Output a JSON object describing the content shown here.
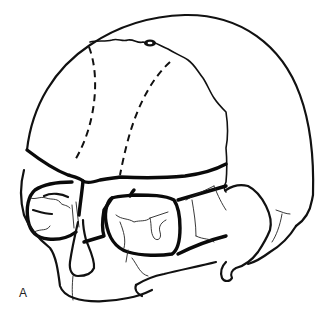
{
  "figure": {
    "label": "A",
    "colors": {
      "background": "#ffffff",
      "ink": "#111111"
    },
    "elements": [
      {
        "name": "cranial-vault-outline",
        "style": "solid"
      },
      {
        "name": "fontanelle",
        "style": "filled-oval"
      },
      {
        "name": "sagittal-suture",
        "style": "solid-wavy"
      },
      {
        "name": "coronal-suture-left",
        "style": "dashed"
      },
      {
        "name": "coronal-suture-right",
        "style": "dashed"
      },
      {
        "name": "supraorbital-margin",
        "style": "heavy"
      },
      {
        "name": "orbit-right",
        "style": "heavy"
      },
      {
        "name": "orbit-left",
        "style": "heavy"
      },
      {
        "name": "nasal-bone",
        "style": "solid"
      },
      {
        "name": "maxilla-mandible",
        "style": "solid"
      },
      {
        "name": "temporal-region",
        "style": "solid"
      }
    ]
  }
}
